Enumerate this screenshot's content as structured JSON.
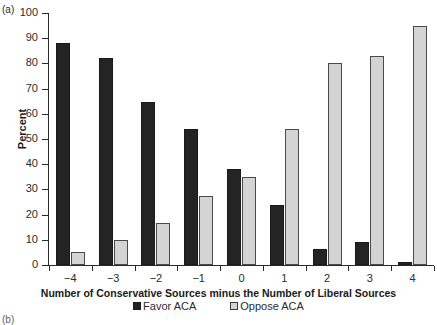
{
  "panels": {
    "letter_a": "(a)",
    "letter_b": "(b)"
  },
  "chart_data": {
    "type": "bar",
    "title": "",
    "xlabel": "Number of Conservative Sources minus the Number of Liberal Sources",
    "ylabel": "Percent",
    "categories": [
      "−4",
      "−3",
      "−2",
      "−1",
      "0",
      "1",
      "2",
      "3",
      "4"
    ],
    "series": [
      {
        "name": "Favor ACA",
        "color": "#242424",
        "values": [
          88,
          82,
          64.5,
          54,
          38,
          24,
          6.5,
          9,
          1
        ]
      },
      {
        "name": "Oppose ACA",
        "color": "#d4d4d4",
        "values": [
          5.3,
          9.8,
          16.5,
          27.3,
          35,
          54,
          80,
          83,
          95
        ]
      }
    ],
    "ylim": [
      0,
      100
    ],
    "yticks": [
      0,
      10,
      20,
      30,
      40,
      50,
      60,
      70,
      80,
      90,
      100
    ],
    "ytick_labels": [
      "0",
      "10",
      "20",
      "30",
      "40",
      "50",
      "60",
      "70",
      "80",
      "90",
      "100"
    ],
    "grid": false,
    "legend_position": "bottom-center"
  },
  "legend": {
    "items": [
      {
        "label": "Favor ACA",
        "swatch": "favor"
      },
      {
        "label": "Oppose ACA",
        "swatch": "oppose"
      }
    ]
  }
}
